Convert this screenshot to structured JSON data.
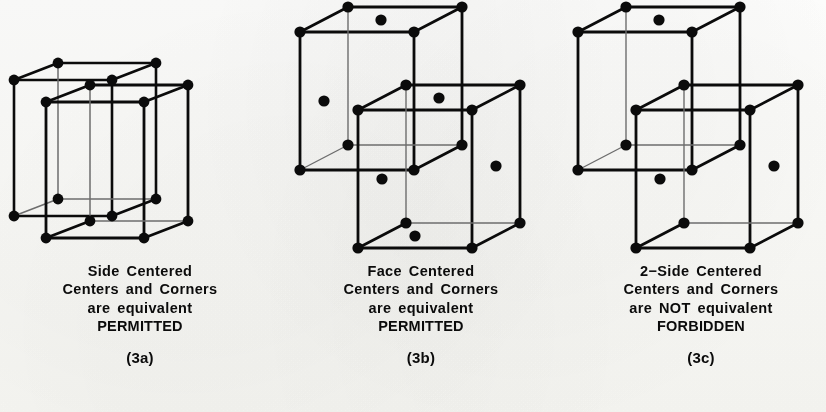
{
  "figure": {
    "background_color": "#fdfdfc",
    "ink_color": "#0b0b0b",
    "thin_line_color": "#5a5a5a",
    "panels": [
      {
        "id": "3a",
        "caption": {
          "line1": "Side Centered",
          "line2": "Centers and Corners",
          "line3": "are equivalent",
          "line4": "PERMITTED",
          "label": "(3a)"
        },
        "lattice": {
          "type": "side-centered",
          "permitted": true,
          "cells": 2,
          "centered_faces": [
            "side"
          ],
          "note": "two side-centered cells sharing a side face"
        }
      },
      {
        "id": "3b",
        "caption": {
          "line1": "Face Centered",
          "line2": "Centers and Corners",
          "line3": "are equivalent",
          "line4": "PERMITTED",
          "label": "(3b)"
        },
        "lattice": {
          "type": "face-centered",
          "permitted": true,
          "cells": 2,
          "centered_faces": [
            "top",
            "bottom",
            "front",
            "back",
            "left",
            "right"
          ],
          "note": "two face-centered cells offset along the body diagonal"
        }
      },
      {
        "id": "3c",
        "caption": {
          "line1": "2−Side Centered",
          "line2": "Centers and Corners",
          "line3": "are NOT equivalent",
          "line4": "FORBIDDEN",
          "label": "(3c)"
        },
        "lattice": {
          "type": "two-side-centered",
          "permitted": false,
          "cells": 2,
          "centered_faces": [
            "top",
            "bottom",
            "left",
            "right"
          ],
          "note": "two cells centered on only two pairs of side faces; right cell clipped at image edge"
        }
      }
    ]
  }
}
